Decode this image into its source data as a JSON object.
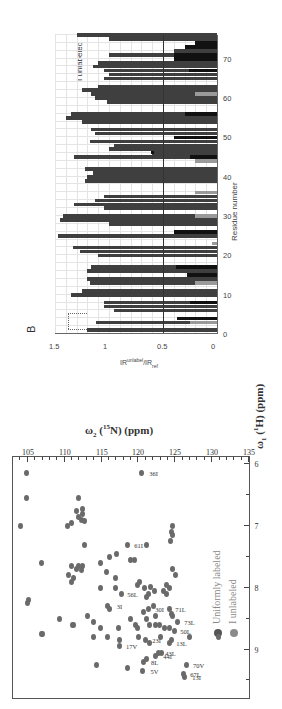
{
  "figure": {
    "rotation_deg": -90,
    "panel_a_letter": "A",
    "panel_b_letter": "B"
  },
  "colors": {
    "uniform": "#555555",
    "unlabeled_fill": "#8a8a8a",
    "bar_dark": "#3f3f3f",
    "bar_black": "#111111",
    "bar_gray": "#9a9a9a",
    "bar_white": "#ffffff",
    "peak": "#6a6a6a"
  },
  "chart_data": [
    {
      "type": "scatter",
      "panel": "A",
      "title": "",
      "xlabel": "ω1 (1H) (ppm)",
      "ylabel": "ω2 (15N) (ppm)",
      "xlim": [
        9.8,
        5.9
      ],
      "ylim": [
        103,
        135
      ],
      "x_ticks": [
        "9",
        "8",
        "7",
        "6"
      ],
      "y_ticks": [
        "105",
        "110",
        "115",
        "120",
        "125",
        "130",
        "135"
      ],
      "legend": [
        {
          "label": "Uniformly labeled",
          "color": "#555555"
        },
        {
          "label": "I unlabeled",
          "color": "#8a8a8a"
        }
      ],
      "annotations": [
        "36I",
        "61I",
        "3I",
        "56L",
        "26V",
        "30I",
        "71L",
        "73L",
        "17V",
        "23I",
        "50L",
        "8L",
        "44I",
        "43L",
        "13L",
        "5V",
        "67L",
        "70V",
        "13I"
      ],
      "points": [
        {
          "x": 6.15,
          "y": 105.0
        },
        {
          "x": 6.55,
          "y": 105.0
        },
        {
          "x": 6.55,
          "y": 112.0
        },
        {
          "x": 6.15,
          "y": 120.6,
          "label": "36I"
        },
        {
          "x": 6.95,
          "y": 111.0
        },
        {
          "x": 6.9,
          "y": 112.4
        },
        {
          "x": 6.85,
          "y": 112.0
        },
        {
          "x": 6.8,
          "y": 112.6
        },
        {
          "x": 6.92,
          "y": 112.8
        },
        {
          "x": 6.75,
          "y": 111.8
        },
        {
          "x": 6.72,
          "y": 112.5
        },
        {
          "x": 7.0,
          "y": 110.5
        },
        {
          "x": 7.0,
          "y": 104.2
        },
        {
          "x": 7.3,
          "y": 112.8
        },
        {
          "x": 7.3,
          "y": 118.6,
          "label": "61I"
        },
        {
          "x": 7.3,
          "y": 121.3
        },
        {
          "x": 7.0,
          "y": 124.7
        },
        {
          "x": 7.1,
          "y": 124.6
        },
        {
          "x": 7.15,
          "y": 124.7
        },
        {
          "x": 7.25,
          "y": 124.5
        },
        {
          "x": 7.6,
          "y": 115.0
        },
        {
          "x": 7.5,
          "y": 116.2
        },
        {
          "x": 7.45,
          "y": 117.2
        },
        {
          "x": 7.55,
          "y": 119.0
        },
        {
          "x": 7.55,
          "y": 119.6
        },
        {
          "x": 7.6,
          "y": 107.0
        },
        {
          "x": 7.65,
          "y": 111.0
        },
        {
          "x": 7.65,
          "y": 112.0
        },
        {
          "x": 7.65,
          "y": 112.6
        },
        {
          "x": 7.7,
          "y": 111.8
        },
        {
          "x": 7.72,
          "y": 112.4
        },
        {
          "x": 7.8,
          "y": 110.6
        },
        {
          "x": 7.85,
          "y": 111.3
        },
        {
          "x": 7.9,
          "y": 111.0
        },
        {
          "x": 7.75,
          "y": 115.8
        },
        {
          "x": 7.85,
          "y": 117.0
        },
        {
          "x": 7.7,
          "y": 124.7
        },
        {
          "x": 7.8,
          "y": 125.2
        },
        {
          "x": 7.9,
          "y": 120.3
        },
        {
          "x": 7.95,
          "y": 120.0
        },
        {
          "x": 8.0,
          "y": 121.0
        },
        {
          "x": 7.98,
          "y": 121.8
        },
        {
          "x": 8.05,
          "y": 122.3
        },
        {
          "x": 8.1,
          "y": 121.5
        },
        {
          "x": 8.15,
          "y": 121.2
        },
        {
          "x": 8.1,
          "y": 117.8,
          "label": "56L"
        },
        {
          "x": 8.1,
          "y": 124.0
        },
        {
          "x": 8.0,
          "y": 124.3
        },
        {
          "x": 8.05,
          "y": 123.5
        },
        {
          "x": 7.95,
          "y": 123.9
        },
        {
          "x": 8.2,
          "y": 105.2
        },
        {
          "x": 8.25,
          "y": 105.1
        },
        {
          "x": 8.0,
          "y": 115.0
        },
        {
          "x": 8.0,
          "y": 117.0
        },
        {
          "x": 8.3,
          "y": 116.0,
          "label": "3I"
        },
        {
          "x": 8.35,
          "y": 116.2
        },
        {
          "x": 8.35,
          "y": 121.5,
          "label": "30I"
        },
        {
          "x": 8.4,
          "y": 120.8
        },
        {
          "x": 8.3,
          "y": 122.2
        },
        {
          "x": 8.35,
          "y": 124.3,
          "label": "71L"
        },
        {
          "x": 8.42,
          "y": 124.6
        },
        {
          "x": 8.45,
          "y": 124.8
        },
        {
          "x": 8.45,
          "y": 122.5
        },
        {
          "x": 8.5,
          "y": 121.3
        },
        {
          "x": 8.5,
          "y": 119.0
        },
        {
          "x": 8.45,
          "y": 113.2
        },
        {
          "x": 8.5,
          "y": 109.5
        },
        {
          "x": 8.6,
          "y": 111.2
        },
        {
          "x": 8.6,
          "y": 111.4
        },
        {
          "x": 8.55,
          "y": 114.0
        },
        {
          "x": 8.65,
          "y": 115.0
        },
        {
          "x": 8.65,
          "y": 117.5
        },
        {
          "x": 8.6,
          "y": 119.7
        },
        {
          "x": 8.65,
          "y": 120.0
        },
        {
          "x": 8.6,
          "y": 121.6
        },
        {
          "x": 8.6,
          "y": 122.4
        },
        {
          "x": 8.6,
          "y": 123.0
        },
        {
          "x": 8.65,
          "y": 123.7
        },
        {
          "x": 8.65,
          "y": 124.3
        },
        {
          "x": 8.55,
          "y": 125.5,
          "label": "73L"
        },
        {
          "x": 8.7,
          "y": 125.0,
          "label": "50L"
        },
        {
          "x": 8.75,
          "y": 107.0
        },
        {
          "x": 8.75,
          "y": 107.1
        },
        {
          "x": 8.8,
          "y": 114.0
        },
        {
          "x": 8.8,
          "y": 116.0
        },
        {
          "x": 8.85,
          "y": 117.6
        },
        {
          "x": 8.8,
          "y": 120.2
        },
        {
          "x": 8.85,
          "y": 121.1,
          "label": "23I"
        },
        {
          "x": 8.9,
          "y": 121.6
        },
        {
          "x": 8.8,
          "y": 123.2
        },
        {
          "x": 8.85,
          "y": 124.6
        },
        {
          "x": 8.9,
          "y": 124.4,
          "label": "13L"
        },
        {
          "x": 8.8,
          "y": 127.0
        },
        {
          "x": 8.95,
          "y": 117.6,
          "label": "17V"
        },
        {
          "x": 9.05,
          "y": 123.3
        },
        {
          "x": 9.05,
          "y": 122.9,
          "label": "43L"
        },
        {
          "x": 9.1,
          "y": 122.5,
          "label": "44I"
        },
        {
          "x": 9.15,
          "y": 121.2
        },
        {
          "x": 9.2,
          "y": 120.8,
          "label": "8L"
        },
        {
          "x": 9.25,
          "y": 114.4
        },
        {
          "x": 9.3,
          "y": 118.6
        },
        {
          "x": 9.35,
          "y": 120.7,
          "label": "5V"
        },
        {
          "x": 9.25,
          "y": 126.7,
          "label": "70V"
        },
        {
          "x": 9.4,
          "y": 126.3,
          "label": "67L"
        },
        {
          "x": 9.45,
          "y": 126.4,
          "label": "13I"
        },
        {
          "x": 8.8,
          "y": 131.0
        }
      ]
    },
    {
      "type": "bar",
      "panel": "B",
      "title": "",
      "xlabel": "Residue number",
      "ylabel": "IR_unlabel / IR_ref",
      "ylim": [
        0,
        1.5
      ],
      "xlim": [
        0,
        76
      ],
      "x_ticks": [
        "0",
        "10",
        "20",
        "30",
        "40",
        "50",
        "60",
        "70"
      ],
      "y_ticks": [
        "0",
        "0.5",
        "1",
        "1.5"
      ],
      "annotation": "I unlabeled",
      "reference_line": 0.5,
      "stacked_segments_note": "Each bar is drawn as a stack: bottom segment (gray or black = isoleucine/residue-specific), dark gray upper segment; white bars = no data region",
      "categories": [
        1,
        2,
        3,
        4,
        5,
        6,
        7,
        8,
        9,
        10,
        11,
        12,
        13,
        14,
        15,
        16,
        17,
        18,
        19,
        20,
        21,
        22,
        23,
        24,
        25,
        26,
        27,
        28,
        29,
        30,
        31,
        32,
        33,
        34,
        35,
        36,
        37,
        38,
        39,
        40,
        41,
        42,
        43,
        44,
        45,
        46,
        47,
        48,
        49,
        50,
        51,
        52,
        53,
        54,
        55,
        56,
        57,
        58,
        59,
        60,
        61,
        62,
        63,
        64,
        65,
        66,
        67,
        68,
        69,
        70,
        71,
        72,
        73,
        74,
        75,
        76
      ],
      "series": [
        {
          "name": "ratio",
          "values": [
            1.2,
            0.0,
            1.12,
            0.0,
            0.0,
            0.95,
            1.05,
            1.05,
            0.0,
            1.35,
            1.25,
            0.0,
            1.18,
            1.2,
            0.0,
            1.2,
            1.17,
            0.0,
            0.0,
            1.1,
            1.27,
            1.33,
            0.05,
            0.0,
            1.47,
            0.0,
            0.0,
            1.0,
            1.45,
            1.43,
            0.0,
            1.05,
            1.32,
            1.13,
            1.05,
            0.0,
            0.0,
            0.0,
            1.22,
            1.2,
            1.15,
            1.22,
            0.0,
            0.0,
            1.32,
            0.6,
            1.0,
            0.95,
            1.18,
            0.0,
            1.13,
            1.17,
            0.0,
            1.25,
            1.4,
            1.35,
            0.0,
            0.0,
            1.02,
            1.13,
            1.17,
            1.25,
            1.1,
            0.0,
            1.05,
            1.0,
            1.05,
            1.15,
            1.1,
            0.0,
            1.0,
            0.4,
            0.0,
            0.0,
            1.0,
            1.3
          ],
          "bottom_segment": [
            {
              "residue": 3,
              "color": "gray",
              "value": 0.25
            },
            {
              "residue": 4,
              "color": "black",
              "value": 0.37
            },
            {
              "residue": 8,
              "color": "black",
              "value": 0.25
            },
            {
              "residue": 13,
              "color": "gray",
              "value": 0.2
            },
            {
              "residue": 15,
              "color": "black",
              "value": 0.28
            },
            {
              "residue": 17,
              "color": "black",
              "value": 0.38
            },
            {
              "residue": 23,
              "color": "gray",
              "value": 0.05
            },
            {
              "residue": 26,
              "color": "black",
              "value": 0.4
            },
            {
              "residue": 30,
              "color": "gray",
              "value": 0.2
            },
            {
              "residue": 36,
              "color": "gray",
              "value": 0.2
            },
            {
              "residue": 44,
              "color": "gray",
              "value": 0.2
            },
            {
              "residue": 45,
              "color": "black",
              "value": 0.25
            },
            {
              "residue": 50,
              "color": "black",
              "value": 0.4
            },
            {
              "residue": 56,
              "color": "black",
              "value": 0.3
            },
            {
              "residue": 61,
              "color": "gray",
              "value": 0.2
            },
            {
              "residue": 67,
              "color": "black",
              "value": 0.26
            },
            {
              "residue": 70,
              "color": "black",
              "value": 0.4
            },
            {
              "residue": 71,
              "color": "black",
              "value": 0.4
            },
            {
              "residue": 73,
              "color": "black",
              "value": 0.3
            },
            {
              "residue": 74,
              "color": "black",
              "value": 0.2
            }
          ]
        }
      ]
    }
  ]
}
